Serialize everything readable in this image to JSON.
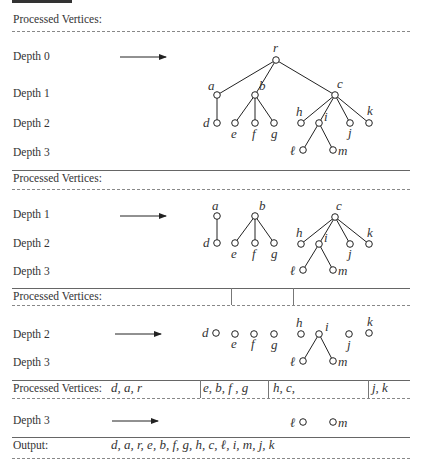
{
  "labels": {
    "processed_vertices": "Processed Vertices:",
    "output": "Output:",
    "depth0": "Depth 0",
    "depth1": "Depth 1",
    "depth2": "Depth 2",
    "depth3": "Depth 3"
  },
  "sections": [
    {
      "name": "stage-1",
      "processed": [],
      "depths": [
        "Depth 0",
        "Depth 1",
        "Depth 2",
        "Depth 3"
      ]
    },
    {
      "name": "stage-2",
      "processed": [],
      "depths": [
        "Depth 1",
        "Depth 2",
        "Depth 3"
      ]
    },
    {
      "name": "stage-3",
      "processed": [
        "",
        "",
        ""
      ],
      "depths": [
        "Depth 2",
        "Depth 3"
      ]
    },
    {
      "name": "stage-4",
      "processed": [
        "d, a, r",
        "e, b, f, g",
        "h, c,",
        "j, k"
      ],
      "depths": [
        "Depth 3"
      ]
    }
  ],
  "processed4": {
    "group1": "d, a, r",
    "group2": "e, b, f , g",
    "group3": "h, c,",
    "group4": "j, k"
  },
  "output": {
    "sequence": "d, a, r, e, b, f, g, h, c, ℓ, i, m, j, k"
  },
  "tree": {
    "nodes": [
      "r",
      "a",
      "b",
      "c",
      "d",
      "e",
      "f",
      "g",
      "h",
      "i",
      "j",
      "k",
      "ℓ",
      "m"
    ],
    "edges": [
      [
        "r",
        "a"
      ],
      [
        "r",
        "b"
      ],
      [
        "r",
        "c"
      ],
      [
        "a",
        "d"
      ],
      [
        "b",
        "e"
      ],
      [
        "b",
        "f"
      ],
      [
        "b",
        "g"
      ],
      [
        "c",
        "h"
      ],
      [
        "c",
        "i"
      ],
      [
        "c",
        "j"
      ],
      [
        "c",
        "k"
      ],
      [
        "i",
        "ℓ"
      ],
      [
        "i",
        "m"
      ]
    ]
  },
  "node_labels": {
    "r": "r",
    "a": "a",
    "b": "b",
    "c": "c",
    "d": "d",
    "e": "e",
    "f": "f",
    "g": "g",
    "h": "h",
    "i": "i",
    "j": "j",
    "k": "k",
    "l": "ℓ",
    "m": "m"
  }
}
